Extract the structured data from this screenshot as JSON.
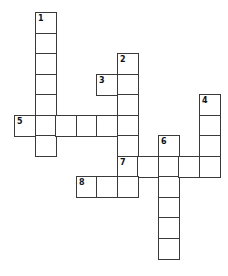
{
  "puzzle": {
    "type": "crossword",
    "origin_x": 14,
    "origin_y": 12,
    "cell_size": 20.5,
    "border_color": "#3a3a3a",
    "words": [
      {
        "number": 1,
        "direction": "down",
        "col": 1,
        "row": 0,
        "length": 7
      },
      {
        "number": 2,
        "direction": "down",
        "col": 5,
        "row": 2,
        "length": 6
      },
      {
        "number": 3,
        "direction": "across",
        "col": 4,
        "row": 3,
        "length": 2
      },
      {
        "number": 4,
        "direction": "down",
        "col": 9,
        "row": 4,
        "length": 4
      },
      {
        "number": 5,
        "direction": "across",
        "col": 0,
        "row": 5,
        "length": 6
      },
      {
        "number": 6,
        "direction": "down",
        "col": 7,
        "row": 6,
        "length": 6
      },
      {
        "number": 7,
        "direction": "across",
        "col": 5,
        "row": 7,
        "length": 5
      },
      {
        "number": 8,
        "direction": "across",
        "col": 3,
        "row": 8,
        "length": 3
      }
    ]
  }
}
